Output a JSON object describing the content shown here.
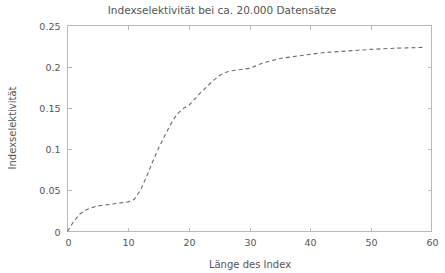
{
  "chart_data": {
    "type": "line",
    "title": "Indexselektivität bei ca. 20.000 Datensätze",
    "xlabel": "Länge des Index",
    "ylabel": "Indexselektivität",
    "xlim": [
      0,
      60
    ],
    "ylim": [
      0,
      0.25
    ],
    "xticks": [
      0,
      10,
      20,
      30,
      40,
      50,
      60
    ],
    "xtick_labels": [
      "0",
      "10",
      "20",
      "30",
      "40",
      "50",
      "60"
    ],
    "yticks": [
      0,
      0.05,
      0.1,
      0.15,
      0.2,
      0.25
    ],
    "ytick_labels": [
      "0",
      "0.05",
      "0.1",
      "0.15",
      "0.2",
      "0.25"
    ],
    "grid": false,
    "legend": false,
    "line_style": "dashed",
    "line_color": "#6e6e6e",
    "series": [
      {
        "name": "Indexselektivität",
        "x": [
          0,
          1,
          2,
          3,
          4,
          5,
          6,
          7,
          8,
          9,
          10,
          11,
          12,
          13,
          14,
          15,
          16,
          17,
          18,
          19,
          20,
          21,
          22,
          23,
          24,
          25,
          26,
          27,
          28,
          29,
          30,
          31,
          32,
          33,
          34,
          35,
          36,
          37,
          38,
          39,
          40,
          42,
          44,
          46,
          48,
          50,
          52,
          54,
          56,
          58,
          59
        ],
        "values": [
          0.0,
          0.012,
          0.021,
          0.026,
          0.029,
          0.031,
          0.032,
          0.033,
          0.034,
          0.035,
          0.036,
          0.039,
          0.05,
          0.066,
          0.084,
          0.101,
          0.116,
          0.13,
          0.142,
          0.149,
          0.153,
          0.161,
          0.169,
          0.176,
          0.183,
          0.189,
          0.193,
          0.195,
          0.196,
          0.197,
          0.198,
          0.201,
          0.204,
          0.206,
          0.208,
          0.21,
          0.211,
          0.212,
          0.213,
          0.214,
          0.215,
          0.217,
          0.218,
          0.219,
          0.22,
          0.221,
          0.2218,
          0.2224,
          0.2229,
          0.2233,
          0.2235
        ]
      }
    ]
  },
  "colors": {
    "background": "#ffffff",
    "text": "#555555",
    "axis": "#b9b9b9",
    "curve": "#6e6e6e"
  }
}
